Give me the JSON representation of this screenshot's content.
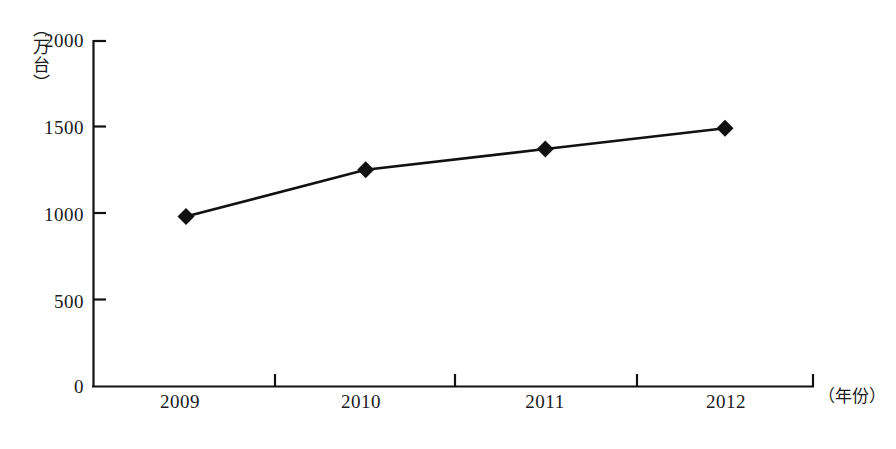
{
  "chart_data": {
    "type": "line",
    "title": "",
    "subtitle": "",
    "xlabel": "（年份）",
    "ylabel": "（万台）",
    "categories": [
      "2009",
      "2010",
      "2011",
      "2012"
    ],
    "values": [
      980,
      1250,
      1370,
      1490
    ],
    "series": [
      {
        "name": "",
        "values": [
          980,
          1250,
          1370,
          1490
        ],
        "marker": "diamond",
        "color": "#000000"
      }
    ],
    "ylim": [
      0,
      2000
    ],
    "y_ticks": [
      0,
      500,
      1000,
      1500,
      2000
    ],
    "y_tick_labels": [
      "0",
      "500",
      "1000",
      "1500",
      "2000"
    ],
    "x_tick_labels": [
      "2009",
      "2010",
      "2011",
      "2012"
    ],
    "grid": false,
    "legend": false,
    "legend_position": "none",
    "axis_color": "#111111",
    "background": "#ffffff"
  },
  "axes": {
    "y_unit_caption": "（万台）",
    "x_unit_caption": "（年份）"
  }
}
